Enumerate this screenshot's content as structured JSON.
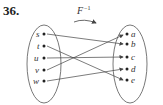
{
  "problem_number": "36.",
  "function_label": "F",
  "function_exponent": "−1",
  "domain_set": [
    "s",
    "t",
    "u",
    "v",
    "w"
  ],
  "codomain_set": [
    "a",
    "b",
    "c",
    "d",
    "e"
  ],
  "mappings": [
    {
      "from": "s",
      "to": "b"
    },
    {
      "from": "t",
      "to": "e"
    },
    {
      "from": "u",
      "to": "c"
    },
    {
      "from": "v",
      "to": "a"
    },
    {
      "from": "w",
      "to": "d"
    }
  ],
  "colors": {
    "line": "#444444",
    "ellipse": "#555555",
    "text": "#333333"
  }
}
